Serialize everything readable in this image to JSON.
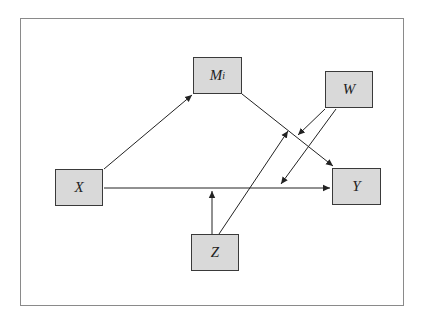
{
  "diagram": {
    "type": "moderated mediation model",
    "nodes": [
      {
        "id": "X",
        "label": "X",
        "sub": ""
      },
      {
        "id": "M",
        "label": "M",
        "sub": "i"
      },
      {
        "id": "W",
        "label": "W",
        "sub": ""
      },
      {
        "id": "Y",
        "label": "Y",
        "sub": ""
      },
      {
        "id": "Z",
        "label": "Z",
        "sub": ""
      }
    ],
    "edges": [
      {
        "from": "X",
        "to": "M_i"
      },
      {
        "from": "M_i",
        "to": "Y"
      },
      {
        "from": "X",
        "to": "Y"
      },
      {
        "from": "Z",
        "to": "X→Y path"
      },
      {
        "from": "Z",
        "to": "M_i→Y path"
      },
      {
        "from": "W",
        "to": "M_i→Y path"
      },
      {
        "from": "W",
        "to": "X→Y path"
      }
    ],
    "colors": {
      "box_fill": "#d9d9d9",
      "box_border": "#3a3a3a",
      "line": "#222222",
      "frame": "#8a8a8a"
    }
  }
}
